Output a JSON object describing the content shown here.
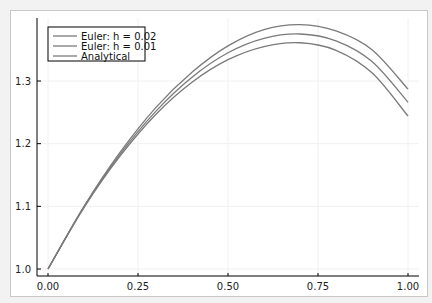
{
  "chart_data": {
    "type": "line",
    "title": "",
    "xlabel": "",
    "ylabel": "",
    "xlim": [
      0,
      1
    ],
    "ylim": [
      0.99,
      1.4
    ],
    "grid": true,
    "legend_position": "top-left",
    "x_ticks": [
      "0.00",
      "0.25",
      "0.50",
      "0.75",
      "1.00"
    ],
    "y_ticks": [
      "1.0",
      "1.1",
      "1.2",
      "1.3"
    ],
    "x": [
      0.0,
      0.1,
      0.2,
      0.3,
      0.4,
      0.5,
      0.6,
      0.7,
      0.8,
      0.9,
      1.0
    ],
    "series": [
      {
        "name": "Euler: h = 0.02",
        "color": "#7a7a7a",
        "values": [
          1.0,
          1.1,
          1.186,
          1.258,
          1.314,
          1.356,
          1.382,
          1.39,
          1.38,
          1.35,
          1.287
        ]
      },
      {
        "name": "Euler: h = 0.01",
        "color": "#7a7a7a",
        "values": [
          1.0,
          1.099,
          1.183,
          1.252,
          1.306,
          1.345,
          1.368,
          1.375,
          1.364,
          1.331,
          1.266
        ]
      },
      {
        "name": "Analytical",
        "color": "#7a7a7a",
        "values": [
          1.0,
          1.098,
          1.18,
          1.247,
          1.298,
          1.334,
          1.355,
          1.361,
          1.349,
          1.313,
          1.244
        ]
      }
    ]
  }
}
